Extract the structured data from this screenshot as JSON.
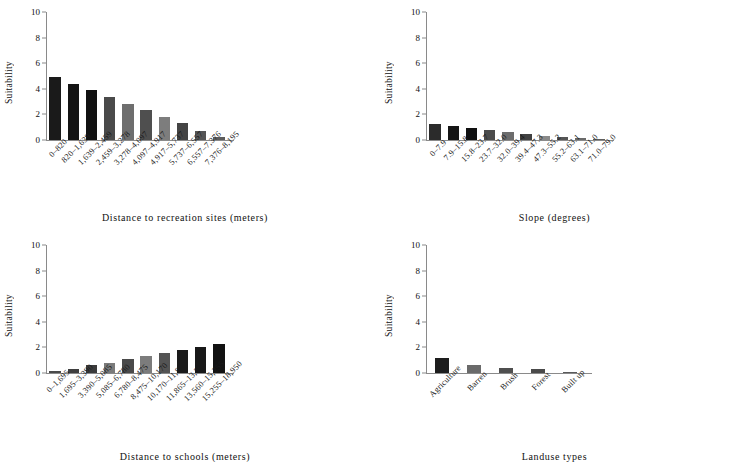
{
  "figure": {
    "ylabel": "Suitability",
    "yticks": [
      0,
      2,
      4,
      6,
      8,
      10
    ],
    "ylim": [
      0,
      10
    ]
  },
  "chart_data": [
    {
      "id": "recreation",
      "type": "bar",
      "title": "",
      "xlabel": "Distance to recreation sites (meters)",
      "ylabel": "Suitability",
      "ylim": [
        0,
        10
      ],
      "yticks": [
        0,
        2,
        4,
        6,
        8,
        10
      ],
      "grid": false,
      "legend": "none",
      "categories": [
        "0–820",
        "820–1,639",
        "1,639–2,459",
        "2,459–3,278",
        "3,278–4,097",
        "4,097–4,917",
        "4,917–5,737",
        "5,737–6,557",
        "6,557–7,376",
        "7,376–8,195"
      ],
      "values": [
        4.95,
        4.4,
        3.9,
        3.35,
        2.85,
        2.35,
        1.8,
        1.35,
        0.7,
        0.2
      ],
      "colors": [
        "#1a1a1a",
        "#141414",
        "#111111",
        "#4a4a4a",
        "#6e6e6e",
        "#4f4f4f",
        "#7d7d7d",
        "#444444",
        "#555555",
        "#5c5c5c"
      ]
    },
    {
      "id": "slope",
      "type": "bar",
      "title": "",
      "xlabel": "Slope (degrees)",
      "ylabel": "Suitability",
      "ylim": [
        0,
        10
      ],
      "yticks": [
        0,
        2,
        4,
        6,
        8,
        10
      ],
      "grid": false,
      "legend": "none",
      "categories": [
        "0–7.9",
        "7.9–15.8",
        "15.8–23.7",
        "23.7–32.0",
        "32.0–39.4",
        "39.4–47.3",
        "47.3–55.2",
        "55.2–63.1",
        "63.1–71.0",
        "71.0–79.0"
      ],
      "values": [
        1.25,
        1.1,
        0.95,
        0.8,
        0.65,
        0.5,
        0.3,
        0.2,
        0.12,
        0.07
      ],
      "colors": [
        "#2b2b2b",
        "#151515",
        "#101010",
        "#4b4b4b",
        "#6d6d6d",
        "#414141",
        "#8a8a8a",
        "#555555",
        "#6a6a6a",
        "#5e5e5e"
      ]
    },
    {
      "id": "schools",
      "type": "bar",
      "title": "",
      "xlabel": "Distance to schools (meters)",
      "ylabel": "Suitability",
      "ylim": [
        0,
        10
      ],
      "yticks": [
        0,
        2,
        4,
        6,
        8,
        10
      ],
      "grid": false,
      "legend": "none",
      "categories": [
        "0–1,695",
        "1,695–3,390",
        "3,390–5,085",
        "5,085–6,780",
        "6,780–8,475",
        "8,475–10,170",
        "10,170–11,865",
        "11,865–13,560",
        "13,560–15,255",
        "15,255–18,950"
      ],
      "values": [
        0.15,
        0.3,
        0.6,
        0.8,
        1.1,
        1.35,
        1.6,
        1.8,
        2.05,
        2.25
      ],
      "colors": [
        "#4a4a4a",
        "#3f3f3f",
        "#3c3c3c",
        "#7b7b7b",
        "#4a4a4a",
        "#7c7c7c",
        "#545454",
        "#1a1a1a",
        "#181818",
        "#121212"
      ]
    },
    {
      "id": "landuse",
      "type": "bar",
      "title": "",
      "xlabel": "Landuse types",
      "ylabel": "Suitability",
      "ylim": [
        0,
        10
      ],
      "yticks": [
        0,
        2,
        4,
        6,
        8,
        10
      ],
      "grid": false,
      "legend": "none",
      "categories": [
        "Agriculture",
        "Barren",
        "Brush",
        "Forest",
        "Built up"
      ],
      "values": [
        1.15,
        0.6,
        0.4,
        0.28,
        0.1
      ],
      "colors": [
        "#1d1d1d",
        "#6a6a6a",
        "#4f4f4f",
        "#4a4a4a",
        "#5a5a5a"
      ]
    }
  ],
  "axis_color": "#8a8a8a"
}
